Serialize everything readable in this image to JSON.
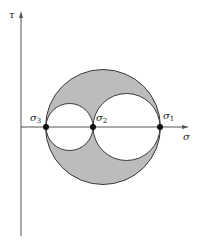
{
  "diagram": {
    "title": "",
    "type": "mohr-circle",
    "colors": {
      "shaded_region": "#bcbcbc",
      "outline": "#3a3a3a",
      "axis": "#555555",
      "point": "#111111",
      "background": "#ffffff"
    },
    "axes": {
      "horizontal": {
        "label": "σ"
      },
      "vertical": {
        "label": "τ"
      }
    },
    "principal_stresses": [
      {
        "id": "sigma3",
        "symbol": "σ",
        "subscript": "3"
      },
      {
        "id": "sigma2",
        "symbol": "σ",
        "subscript": "2"
      },
      {
        "id": "sigma1",
        "symbol": "σ",
        "subscript": "1"
      }
    ],
    "circles": [
      {
        "name": "outer-circle",
        "between": [
          "σ3",
          "σ1"
        ],
        "shaded_ring": true
      },
      {
        "name": "small-circle",
        "between": [
          "σ3",
          "σ2"
        ]
      },
      {
        "name": "medium-circle",
        "between": [
          "σ2",
          "σ1"
        ]
      }
    ]
  }
}
